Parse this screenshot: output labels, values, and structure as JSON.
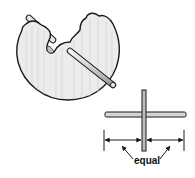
{
  "figure": {
    "type": "woodworking-instruction-illustration",
    "colors": {
      "outline": "#1a1a1a",
      "wood_fill": "#ececec",
      "wood_grain": "#cfcfcf",
      "dowel_fill": "#d9d9d9",
      "background": "#ffffff"
    }
  },
  "part_view": {
    "description": "carved half-disc workpiece with dowel passing through"
  },
  "detail_view": {
    "description": "cross of horizontal bar and vertical dowel, centered",
    "dimension_label": "equal"
  }
}
